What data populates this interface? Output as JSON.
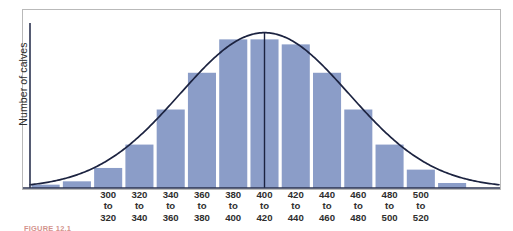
{
  "figure": {
    "caption": "FIGURE 12.1",
    "y_axis_label": "Number of calves"
  },
  "colors": {
    "bar_fill": "#8b9dc8",
    "curve_stroke": "#1c2340",
    "axis_stroke": "#2b3350",
    "frame_border": "#b9b9b9",
    "label_text": "#2e2e2e",
    "caption_text": "#b03a2e",
    "background": "#ffffff"
  },
  "chart_data": {
    "type": "bar",
    "title": "",
    "subtitle": "",
    "xlabel": "",
    "ylabel": "Number of calves",
    "grid": false,
    "legend": "none",
    "xlim": [
      260,
      560
    ],
    "ylim": [
      0,
      100
    ],
    "bin_width": 20,
    "categories": [
      "260 to 280",
      "280 to 300",
      "300 to 320",
      "320 to 340",
      "340 to 360",
      "360 to 380",
      "380 to 400",
      "400 to 420",
      "420 to 440",
      "440 to 460",
      "460 to 480",
      "480 to 500",
      "500 to 520",
      "520 to 540"
    ],
    "tick_labels": [
      [
        "300",
        "to",
        "320"
      ],
      [
        "320",
        "to",
        "340"
      ],
      [
        "340",
        "to",
        "360"
      ],
      [
        "360",
        "to",
        "380"
      ],
      [
        "380",
        "to",
        "400"
      ],
      [
        "400",
        "to",
        "420"
      ],
      [
        "420",
        "to",
        "440"
      ],
      [
        "440",
        "to",
        "460"
      ],
      [
        "460",
        "to",
        "480"
      ],
      [
        "480",
        "to",
        "500"
      ],
      [
        "500",
        "to",
        "520"
      ]
    ],
    "values": [
      2,
      4,
      12,
      26,
      47,
      69,
      89,
      89,
      86,
      69,
      47,
      26,
      11,
      3
    ],
    "bin_centers": [
      270,
      290,
      310,
      330,
      350,
      370,
      390,
      410,
      430,
      450,
      470,
      490,
      510,
      530
    ],
    "overlay_curve": {
      "name": "normal curve",
      "mean": 410,
      "sd": 54,
      "peak_value": 93
    },
    "mean_line": {
      "label": "",
      "x_value": 410
    },
    "annotations": []
  }
}
